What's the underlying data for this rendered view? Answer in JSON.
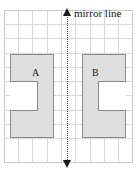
{
  "figure": {
    "type": "reflection-symmetry-grid-diagram",
    "background_color": "#ffffff"
  },
  "grid": {
    "line_color": "#d8d8d8",
    "edge_color": "#c9c9c9",
    "cell_size_px": 14.3,
    "columns": 9,
    "rows": 11,
    "left_px": 4,
    "top_px": 10,
    "width_px": 129,
    "height_px": 153
  },
  "mirror_line": {
    "label": "mirror line",
    "style": "dotted",
    "color": "#3a3a3a",
    "orientation": "vertical",
    "x_px": 68,
    "arrow_top": "▲",
    "arrow_bottom": "▼",
    "arrow_color": "#1a1a1a"
  },
  "shapes": [
    {
      "label": "A",
      "name": "shape-a",
      "description": "C-shape opening to the right (left of mirror line)",
      "fill_color": "#dedede",
      "stroke_color": "#8a8a8a",
      "opens": "right"
    },
    {
      "label": "B",
      "name": "shape-b",
      "description": "C-shape opening to the left (right of mirror line), reflection of A",
      "fill_color": "#dedede",
      "stroke_color": "#8a8a8a",
      "opens": "left"
    }
  ]
}
